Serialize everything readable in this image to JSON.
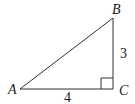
{
  "figure": {
    "type": "right-triangle",
    "vertices": {
      "A": {
        "label": "A",
        "x": 20,
        "y": 89
      },
      "B": {
        "label": "B",
        "x": 113,
        "y": 18
      },
      "C": {
        "label": "C",
        "x": 113,
        "y": 89
      }
    },
    "sides": {
      "AC": {
        "label": "4"
      },
      "BC": {
        "label": "3"
      }
    },
    "right_angle_at": "C",
    "colors": {
      "stroke": "#333333",
      "text": "#1a1a1a",
      "background": "#ffffff"
    }
  }
}
